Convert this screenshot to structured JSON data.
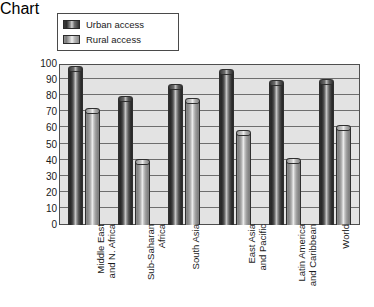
{
  "chart_data": {
    "type": "bar",
    "title": "",
    "subtitle": "",
    "xlabel": "",
    "ylabel": "Percent of population",
    "ylim": [
      0,
      100
    ],
    "ytick_step": 10,
    "yticks": [
      "100",
      "90",
      "80",
      "70",
      "60",
      "50",
      "40",
      "30",
      "20",
      "10",
      "0"
    ],
    "grid": true,
    "grid_axis": "y",
    "legend_position": "top-left",
    "orientation": "vertical",
    "categories": [
      "Middle East\nand N. Africa",
      "Sub-Saharan\nAfrica",
      "South Asia",
      "East Asia\nand Pacific",
      "Latin America\nand Caribbean",
      "World"
    ],
    "series": [
      {
        "name": "Urban access",
        "color": "#3a3a3a",
        "values": [
          97,
          78,
          86,
          95,
          88,
          89
        ]
      },
      {
        "name": "Rural access",
        "color": "#b4b4b4",
        "values": [
          71,
          39,
          77,
          57,
          40,
          60
        ]
      }
    ]
  },
  "legend": {
    "items": [
      {
        "label": "Urban access",
        "swatch": "urban-swatch"
      },
      {
        "label": "Rural access",
        "swatch": "rural-swatch"
      }
    ]
  },
  "axes": {
    "y_title": "Percent of population"
  },
  "colors": {
    "plot_background": "#e3e3e3",
    "frame": "#4f4f4f",
    "gridline": "#6e6e6e",
    "text": "#1a1a1a",
    "page_background": "#ffffff"
  }
}
